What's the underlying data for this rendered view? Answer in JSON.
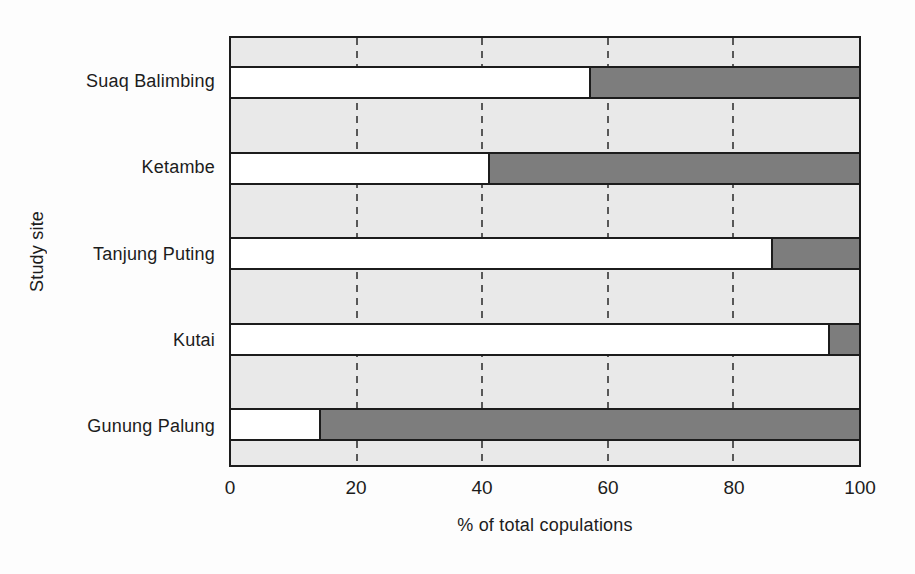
{
  "figure": {
    "background": "#fdfdfd",
    "text_color": "#1c1c1c"
  },
  "chart_data": {
    "type": "bar",
    "subtype": "horizontal-stacked",
    "title": "",
    "xlabel": "% of total copulations",
    "ylabel": "Study site",
    "xlim": [
      0,
      100
    ],
    "xticks": [
      0,
      20,
      40,
      60,
      80,
      100
    ],
    "gridlines": {
      "axis": "x",
      "at": [
        20,
        40,
        60,
        80
      ],
      "style": "dashed",
      "color": "#585858"
    },
    "legend": "none",
    "plot_background": "#e9e9e9",
    "outline_color": "#1c1c1c",
    "categories": [
      "Suaq Balimbing",
      "Ketambe",
      "Tanjung Puting",
      "Kutai",
      "Gunung Palung"
    ],
    "series": [
      {
        "name": "white-segment",
        "color": "#ffffff",
        "values": [
          57,
          41,
          86,
          95,
          14
        ]
      },
      {
        "name": "dark-grey-segment",
        "color": "#7d7d7d",
        "values": [
          43,
          59,
          14,
          5,
          86
        ]
      }
    ]
  }
}
